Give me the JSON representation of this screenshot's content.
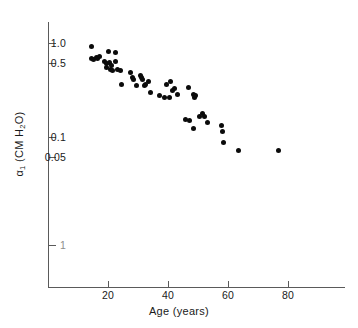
{
  "figure": {
    "background": "#ffffff",
    "point_color": "#0b0b0b",
    "axis_color": "#5a5a5a"
  },
  "axes": {
    "y_title": "α₁ (CM H₂O)",
    "y_title_plain": "alpha1 (CM H2O)",
    "x_title": "Age (years)",
    "y_ticks": [
      {
        "label": "1.0",
        "value": 1.0,
        "y_px": 43,
        "faint": false
      },
      {
        "label": "0.5",
        "value": 0.5,
        "y_px": 63,
        "faint": false
      },
      {
        "label": "0.1",
        "value": 0.1,
        "y_px": 137,
        "faint": false
      },
      {
        "label": "0.05",
        "value": 0.05,
        "y_px": 157,
        "faint": false
      },
      {
        "label": "1",
        "value": 0.01,
        "y_px": 245,
        "faint": true
      }
    ],
    "x_ticks": [
      {
        "label": "20",
        "value": 20,
        "x_px": 108
      },
      {
        "label": "40",
        "value": 40,
        "x_px": 168
      },
      {
        "label": "60",
        "value": 60,
        "x_px": 228
      },
      {
        "label": "80",
        "value": 80,
        "x_px": 288
      }
    ]
  },
  "chart_data": {
    "type": "scatter",
    "title": "",
    "xlabel": "Age (years)",
    "ylabel": "α₁ (CM H₂O)",
    "xlim": [
      5,
      104
    ],
    "ylim": [
      0.0095,
      1.35
    ],
    "yscale": "log",
    "xscale": "linear",
    "grid": false,
    "legend": null,
    "marker": "filled-circle",
    "n_points": 56,
    "points": [
      {
        "x": 14.5,
        "y": 0.92
      },
      {
        "x": 14.6,
        "y": 0.66
      },
      {
        "x": 15.2,
        "y": 0.64
      },
      {
        "x": 16.0,
        "y": 0.68
      },
      {
        "x": 16.4,
        "y": 0.66
      },
      {
        "x": 17.0,
        "y": 0.7
      },
      {
        "x": 18.8,
        "y": 0.62
      },
      {
        "x": 19.4,
        "y": 0.58
      },
      {
        "x": 19.6,
        "y": 0.52
      },
      {
        "x": 20.0,
        "y": 0.8
      },
      {
        "x": 20.6,
        "y": 0.6
      },
      {
        "x": 20.8,
        "y": 0.5
      },
      {
        "x": 21.0,
        "y": 0.55
      },
      {
        "x": 21.4,
        "y": 0.48
      },
      {
        "x": 22.4,
        "y": 0.78
      },
      {
        "x": 22.6,
        "y": 0.62
      },
      {
        "x": 23.0,
        "y": 0.5
      },
      {
        "x": 24.0,
        "y": 0.49
      },
      {
        "x": 24.6,
        "y": 0.34
      },
      {
        "x": 27.6,
        "y": 0.46
      },
      {
        "x": 28.2,
        "y": 0.4
      },
      {
        "x": 28.6,
        "y": 0.38
      },
      {
        "x": 29.4,
        "y": 0.33
      },
      {
        "x": 30.8,
        "y": 0.43
      },
      {
        "x": 31.2,
        "y": 0.4
      },
      {
        "x": 31.6,
        "y": 0.38
      },
      {
        "x": 32.0,
        "y": 0.33
      },
      {
        "x": 32.4,
        "y": 0.34
      },
      {
        "x": 33.4,
        "y": 0.36
      },
      {
        "x": 34.0,
        "y": 0.27
      },
      {
        "x": 37.2,
        "y": 0.25
      },
      {
        "x": 38.8,
        "y": 0.24
      },
      {
        "x": 39.6,
        "y": 0.34
      },
      {
        "x": 40.4,
        "y": 0.24
      },
      {
        "x": 40.8,
        "y": 0.36
      },
      {
        "x": 41.4,
        "y": 0.29
      },
      {
        "x": 42.0,
        "y": 0.3
      },
      {
        "x": 43.0,
        "y": 0.26
      },
      {
        "x": 45.8,
        "y": 0.135
      },
      {
        "x": 46.8,
        "y": 0.31
      },
      {
        "x": 47.0,
        "y": 0.13
      },
      {
        "x": 48.4,
        "y": 0.26
      },
      {
        "x": 48.6,
        "y": 0.105
      },
      {
        "x": 48.8,
        "y": 0.24
      },
      {
        "x": 49.0,
        "y": 0.25
      },
      {
        "x": 50.6,
        "y": 0.145
      },
      {
        "x": 51.4,
        "y": 0.155
      },
      {
        "x": 52.0,
        "y": 0.145
      },
      {
        "x": 53.2,
        "y": 0.125
      },
      {
        "x": 57.8,
        "y": 0.115
      },
      {
        "x": 58.2,
        "y": 0.097
      },
      {
        "x": 58.6,
        "y": 0.073
      },
      {
        "x": 63.4,
        "y": 0.06
      },
      {
        "x": 76.8,
        "y": 0.06
      }
    ]
  }
}
